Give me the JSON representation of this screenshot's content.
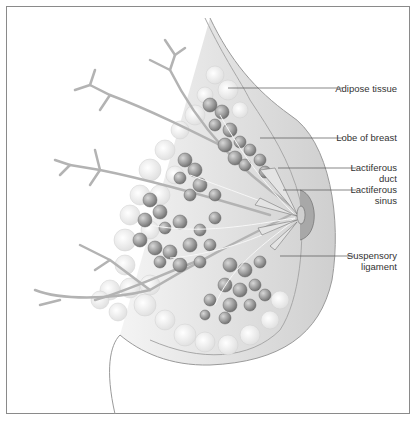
{
  "figure": {
    "labels": [
      {
        "id": "adipose",
        "lines": [
          "Adipose tissue"
        ]
      },
      {
        "id": "lobe",
        "lines": [
          "Lobe of breast"
        ]
      },
      {
        "id": "duct",
        "lines": [
          "Lactiferous",
          "duct"
        ]
      },
      {
        "id": "sinus",
        "lines": [
          "Lactiferous",
          "sinus"
        ]
      },
      {
        "id": "ligament",
        "lines": [
          "Suspensory",
          "ligament"
        ]
      }
    ]
  },
  "colors": {
    "frame": "#8a8a8a",
    "skin_shade": "#d9d9d9",
    "lobules": "#8c8c8c",
    "adipose": "#ececec",
    "vessels": "#b0b0b0",
    "leader_line": "#555555"
  }
}
